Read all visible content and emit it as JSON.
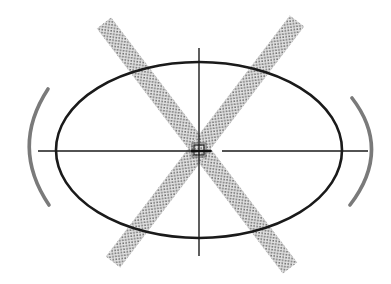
{
  "diagram": {
    "type": "ellipse-with-crossed-bands",
    "canvas": {
      "width": 391,
      "height": 284,
      "background": "#ffffff"
    },
    "ellipse": {
      "cx": 199,
      "cy": 150,
      "rx": 143,
      "ry": 88,
      "stroke": "#1a1a1a",
      "stroke_width": 2.6
    },
    "axes": {
      "horizontal": {
        "x1": 38,
        "x2": 368,
        "y": 151,
        "gap_from": 212,
        "gap_to": 222,
        "stroke": "#1a1a1a"
      },
      "vertical": {
        "x": 199,
        "y1": 48,
        "y2": 256,
        "stroke": "#1a1a1a"
      }
    },
    "bands": [
      {
        "name": "band-descending",
        "x1": 104,
        "y1": 23,
        "x2": 290,
        "y2": 268,
        "width": 18,
        "color": "#8a8a8a"
      },
      {
        "name": "band-ascending",
        "x1": 297,
        "y1": 21,
        "x2": 113,
        "y2": 262,
        "width": 18,
        "color": "#8a8a8a"
      }
    ],
    "brackets": [
      {
        "name": "left-bracket",
        "path": "M 48 89 Q 10 147 49 205",
        "color": "#7a7a7a",
        "stroke_width": 3.6
      },
      {
        "name": "right-bracket",
        "path": "M 352 98 Q 392 150 350 205",
        "color": "#7a7a7a",
        "stroke_width": 3.6
      }
    ],
    "center_marker": {
      "x": 199,
      "y": 150,
      "size": 10,
      "color": "#555555"
    }
  }
}
